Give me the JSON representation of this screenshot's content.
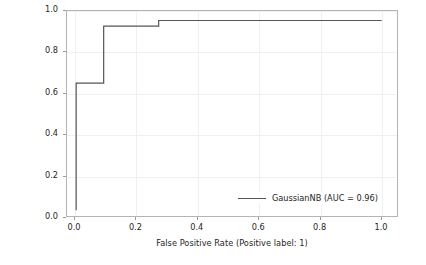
{
  "chart_data": {
    "type": "line",
    "title": "",
    "xlabel": "False Positive Rate (Positive label: 1)",
    "ylabel": "True Positive Rate (Positive label: 1)",
    "xlim": [
      -0.03,
      1.05
    ],
    "ylim": [
      -0.03,
      1.05
    ],
    "grid": true,
    "legend_position": "lower right",
    "xticks": [
      "0.0",
      "0.2",
      "0.4",
      "0.6",
      "0.8",
      "1.0"
    ],
    "xtick_values": [
      0.0,
      0.2,
      0.4,
      0.6,
      0.8,
      1.0
    ],
    "yticks": [
      "0.0",
      "0.2",
      "0.4",
      "0.6",
      "0.8",
      "1.0"
    ],
    "ytick_values": [
      0.0,
      0.2,
      0.4,
      0.6,
      0.8,
      1.0
    ],
    "series": [
      {
        "name": "GaussianNB (AUC = 0.96)",
        "color": "#555555",
        "drawstyle": "steps-post",
        "x": [
          0.0,
          0.0,
          0.09,
          0.09,
          0.27,
          0.27,
          1.0
        ],
        "y": [
          0.0,
          0.67,
          0.67,
          0.97,
          0.97,
          1.0,
          1.0
        ]
      }
    ]
  },
  "legend": {
    "entries": [
      {
        "label": "GaussianNB (AUC = 0.96)",
        "color": "#555555"
      }
    ]
  },
  "axes": {
    "x_label": "False Positive Rate (Positive label: 1)",
    "y_label": "True Positive Rate (Positive label: 1)"
  },
  "colors": {
    "curve": "#555555",
    "grid": "#f0f0f0",
    "frame": "#b4b4b4",
    "text": "#262626",
    "background": "#ffffff"
  }
}
